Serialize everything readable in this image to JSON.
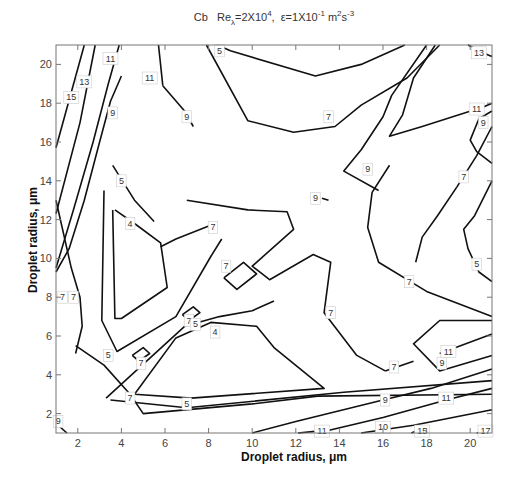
{
  "chart_data": {
    "type": "contour",
    "title": {
      "prefix": "Cb",
      "re_base": "Re",
      "re_sub": "λ",
      "re_value": "=2X10",
      "re_exp": "4",
      "sep": ",",
      "eps_base": "ε=1X10",
      "eps_exp": "-1",
      "unit_m": " m",
      "unit_m_exp": "2",
      "unit_s": "s",
      "unit_s_exp": "-3"
    },
    "xlabel": "Droplet radius, μm",
    "ylabel": "Droplet radius, μm",
    "xlim": [
      1,
      21
    ],
    "ylim": [
      1,
      21
    ],
    "xticks": [
      2,
      4,
      6,
      8,
      10,
      12,
      14,
      16,
      18,
      20
    ],
    "yticks": [
      2,
      4,
      6,
      8,
      10,
      12,
      14,
      16,
      18,
      20
    ],
    "grid": false,
    "contours": [
      {
        "level": 15,
        "points": [
          [
            1.0,
            15.7
          ],
          [
            2.3,
            21.0
          ]
        ],
        "label_at": [
          1.7,
          18.3
        ]
      },
      {
        "level": 13,
        "points": [
          [
            1.0,
            12.3
          ],
          [
            2.1,
            17.0
          ],
          [
            2.8,
            21.0
          ]
        ],
        "label_at": [
          2.3,
          19.1
        ]
      },
      {
        "level": 11,
        "points": [
          [
            1.0,
            9.5
          ],
          [
            1.8,
            12.5
          ],
          [
            2.7,
            16.0
          ],
          [
            3.4,
            19.0
          ],
          [
            3.9,
            21.0
          ]
        ],
        "label_at": [
          3.5,
          20.3
        ]
      },
      {
        "level": 9,
        "points": [
          [
            1.0,
            9.3
          ],
          [
            1.6,
            10.5
          ],
          [
            2.3,
            13.0
          ],
          [
            3.0,
            16.0
          ],
          [
            3.5,
            18.1
          ],
          [
            4.0,
            19.4
          ]
        ],
        "label_at": [
          3.6,
          17.5
        ]
      },
      {
        "level": 7,
        "points": [
          [
            1.0,
            1.0
          ]
        ],
        "label_at": [
          1.3,
          8.0
        ]
      },
      {
        "level": 9,
        "points": [
          [
            1.0,
            1.5
          ],
          [
            1.5,
            1.0
          ]
        ],
        "label_at": [
          1.1,
          1.6
        ]
      },
      {
        "level": 5,
        "points": [
          [
            3.6,
            14.8
          ],
          [
            4.6,
            13.0
          ],
          [
            5.5,
            11.9
          ]
        ],
        "label_at": [
          4.0,
          14.0
        ]
      },
      {
        "level": 4,
        "points": [
          [
            3.7,
            12.5
          ],
          [
            4.6,
            11.8
          ],
          [
            5.8,
            10.8
          ],
          [
            6.1,
            8.5
          ],
          [
            4.0,
            6.9
          ],
          [
            3.7,
            6.9
          ],
          [
            3.6,
            12.5
          ]
        ],
        "label_at": [
          4.4,
          11.8
        ]
      },
      {
        "level": 5,
        "points": [
          [
            3.2,
            13.5
          ],
          [
            3.1,
            6.8
          ],
          [
            3.8,
            5.2
          ],
          [
            6.5,
            7.0
          ],
          [
            8.1,
            10.1
          ],
          [
            8.6,
            11.0
          ]
        ],
        "label_at": [
          3.4,
          5.0
        ]
      },
      {
        "level": 7,
        "points": [
          [
            5.8,
            10.6
          ],
          [
            6.5,
            11.0
          ],
          [
            8.3,
            11.8
          ]
        ],
        "label_at": [
          8.2,
          11.6
        ]
      },
      {
        "level": 7,
        "points": [
          [
            8.7,
            9.0
          ],
          [
            9.3,
            8.4
          ],
          [
            10.2,
            9.2
          ],
          [
            9.6,
            9.8
          ],
          [
            8.7,
            9.0
          ]
        ],
        "label_at": [
          8.8,
          9.6
        ]
      },
      {
        "level": 7,
        "points": [
          [
            6.8,
            7.1
          ],
          [
            7.1,
            6.8
          ],
          [
            7.6,
            7.2
          ],
          [
            7.3,
            7.5
          ],
          [
            6.8,
            7.1
          ]
        ],
        "label_at": [
          7.1,
          6.8
        ]
      },
      {
        "level": 7,
        "points": [
          [
            4.5,
            5.0
          ],
          [
            4.8,
            4.7
          ],
          [
            5.3,
            5.1
          ],
          [
            5.0,
            5.4
          ],
          [
            4.5,
            5.0
          ]
        ],
        "label_at": [
          4.9,
          4.6
        ]
      },
      {
        "level": 5,
        "points": [
          [
            3.3,
            2.8
          ],
          [
            6.9,
            6.5
          ],
          [
            8.5,
            7.0
          ],
          [
            10.0,
            7.3
          ],
          [
            11.0,
            7.8
          ]
        ],
        "label_at": [
          7.4,
          6.6
        ]
      },
      {
        "level": 4,
        "points": [
          [
            4.6,
            3.0
          ],
          [
            6.5,
            5.9
          ],
          [
            8.1,
            6.7
          ],
          [
            10.2,
            6.5
          ],
          [
            11.0,
            5.4
          ],
          [
            13.3,
            3.3
          ],
          [
            7.2,
            2.8
          ],
          [
            4.6,
            3.0
          ]
        ],
        "label_at": [
          8.3,
          6.2
        ]
      },
      {
        "level": 5,
        "points": [
          [
            3.5,
            2.7
          ],
          [
            7.0,
            2.3
          ],
          [
            14.2,
            3.1
          ],
          [
            21.0,
            3.7
          ]
        ],
        "label_at": [
          7.0,
          2.5
        ]
      },
      {
        "level": 7,
        "points": [
          [
            1.9,
            5.5
          ],
          [
            3.2,
            4.5
          ],
          [
            4.4,
            3.0
          ],
          [
            5.0,
            2.0
          ],
          [
            10.0,
            2.5
          ],
          [
            13.0,
            2.9
          ],
          [
            21.0,
            3.0
          ]
        ],
        "label_at": [
          4.4,
          2.8
        ]
      },
      {
        "level": 7,
        "points": [
          [
            1.0,
            13.0
          ],
          [
            1.7,
            9.5
          ],
          [
            2.1,
            8.0
          ],
          [
            2.2,
            6.5
          ],
          [
            1.9,
            5.1
          ]
        ],
        "label_at": [
          1.8,
          8.0
        ]
      },
      {
        "level": 9,
        "points": [
          [
            10.0,
            1.0
          ],
          [
            12.0,
            1.6
          ],
          [
            16.0,
            2.7
          ],
          [
            18.2,
            3.3
          ],
          [
            21.0,
            4.3
          ]
        ],
        "label_at": [
          16.1,
          2.7
        ]
      },
      {
        "level": 11,
        "points": [
          [
            13.0,
            1.0
          ],
          [
            16.0,
            1.8
          ],
          [
            18.9,
            2.7
          ],
          [
            21.0,
            3.3
          ]
        ],
        "label_at": [
          18.9,
          2.8
        ]
      },
      {
        "level": 10,
        "points": [
          [
            15.0,
            1.0
          ],
          [
            17.4,
            1.4
          ],
          [
            21.0,
            2.2
          ]
        ],
        "label_at": [
          16.0,
          1.3
        ]
      },
      {
        "level": 11,
        "points": [
          [
            12.1,
            1.0
          ],
          [
            13.0,
            1.1
          ]
        ],
        "label_at": [
          13.2,
          1.1
        ]
      },
      {
        "level": 15,
        "points": [
          [
            17.3,
            1.0
          ],
          [
            17.8,
            1.2
          ]
        ],
        "label_at": [
          17.8,
          1.1
        ]
      },
      {
        "level": 17,
        "points": [
          [
            20.3,
            1.0
          ],
          [
            21.0,
            1.2
          ]
        ],
        "label_at": [
          20.7,
          1.1
        ]
      },
      {
        "level": 5,
        "points": [
          [
            8.4,
            21.0
          ],
          [
            9.0,
            20.7
          ],
          [
            12.9,
            19.4
          ],
          [
            15.0,
            20.0
          ],
          [
            17.0,
            21.0
          ]
        ],
        "label_at": [
          8.5,
          20.7
        ]
      },
      {
        "level": 7,
        "points": [
          [
            7.9,
            21.0
          ],
          [
            9.8,
            17.1
          ],
          [
            11.9,
            16.5
          ],
          [
            13.8,
            16.8
          ],
          [
            15.0,
            17.9
          ],
          [
            17.1,
            19.3
          ],
          [
            18.6,
            21.0
          ]
        ],
        "label_at": [
          13.5,
          17.3
        ]
      },
      {
        "level": 11,
        "points": [
          [
            5.7,
            21.0
          ],
          [
            5.9,
            18.9
          ]
        ],
        "label_at": [
          5.3,
          19.3
        ]
      },
      {
        "level": 9,
        "points": [
          [
            5.9,
            18.9
          ],
          [
            6.9,
            17.6
          ],
          [
            7.3,
            16.8
          ]
        ],
        "label_at": [
          7.0,
          17.3
        ]
      },
      {
        "level": 9,
        "points": [
          [
            18.0,
            21.0
          ],
          [
            16.4,
            18.4
          ],
          [
            16.0,
            17.3
          ],
          [
            15.0,
            15.6
          ],
          [
            14.2,
            14.5
          ],
          [
            15.8,
            13.5
          ]
        ],
        "label_at": [
          15.3,
          14.6
        ]
      },
      {
        "level": 9,
        "points": [
          [
            13.5,
            13.0
          ],
          [
            13.2,
            13.1
          ]
        ],
        "label_at": [
          12.9,
          13.1
        ]
      },
      {
        "level": 7,
        "points": [
          [
            7.0,
            13.0
          ],
          [
            9.8,
            12.5
          ],
          [
            11.6,
            12.4
          ],
          [
            11.9,
            11.5
          ],
          [
            10.0,
            9.6
          ],
          [
            10.8,
            8.9
          ],
          [
            12.8,
            10.2
          ],
          [
            13.6,
            9.8
          ],
          [
            13.3,
            7.2
          ],
          [
            14.8,
            5.0
          ],
          [
            16.1,
            4.2
          ]
        ],
        "label_at": [
          13.6,
          7.2
        ]
      },
      {
        "level": 11,
        "points": [
          [
            18.4,
            21.0
          ],
          [
            17.4,
            19.3
          ],
          [
            16.9,
            17.4
          ],
          [
            16.3,
            16.3
          ],
          [
            17.8,
            16.8
          ],
          [
            20.6,
            17.8
          ],
          [
            21.0,
            18.0
          ]
        ],
        "label_at": [
          20.3,
          17.7
        ]
      },
      {
        "level": 13,
        "points": [
          [
            19.9,
            21.0
          ],
          [
            20.8,
            20.5
          ],
          [
            21.0,
            20.4
          ]
        ],
        "label_at": [
          20.4,
          20.6
        ]
      },
      {
        "level": 9,
        "points": [
          [
            21.0,
            17.6
          ],
          [
            20.4,
            17.2
          ],
          [
            20.0,
            16.1
          ],
          [
            20.3,
            15.5
          ],
          [
            21.0,
            14.9
          ]
        ],
        "label_at": [
          20.6,
          17.0
        ]
      },
      {
        "level": 7,
        "points": [
          [
            21.0,
            16.8
          ],
          [
            20.3,
            15.3
          ],
          [
            19.4,
            13.7
          ],
          [
            18.5,
            12.2
          ],
          [
            17.8,
            11.1
          ],
          [
            17.5,
            9.8
          ]
        ],
        "label_at": [
          19.7,
          14.2
        ]
      },
      {
        "level": 5,
        "points": [
          [
            21.0,
            14.0
          ],
          [
            20.2,
            12.2
          ],
          [
            19.7,
            11.5
          ],
          [
            19.9,
            10.5
          ],
          [
            20.4,
            9.3
          ],
          [
            21.0,
            8.8
          ]
        ],
        "label_at": [
          20.3,
          9.7
        ]
      },
      {
        "level": 7,
        "points": [
          [
            16.3,
            14.8
          ],
          [
            15.5,
            13.4
          ],
          [
            15.3,
            11.6
          ],
          [
            15.8,
            9.8
          ],
          [
            18.0,
            8.3
          ],
          [
            21.0,
            7.0
          ]
        ],
        "label_at": [
          17.2,
          8.8
        ]
      },
      {
        "level": 9,
        "points": [
          [
            21.0,
            6.8
          ],
          [
            18.6,
            6.8
          ],
          [
            17.4,
            5.6
          ],
          [
            18.6,
            4.2
          ],
          [
            21.0,
            5.0
          ]
        ],
        "label_at": [
          18.7,
          4.6
        ]
      },
      {
        "level": 11,
        "points": [
          [
            18.6,
            5.1
          ],
          [
            21.0,
            6.1
          ]
        ],
        "label_at": [
          19.0,
          5.2
        ]
      },
      {
        "level": 7,
        "points": [
          [
            17.4,
            4.7
          ],
          [
            16.1,
            4.2
          ]
        ],
        "label_at": [
          16.5,
          4.4
        ]
      }
    ]
  }
}
